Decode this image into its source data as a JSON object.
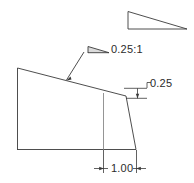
{
  "drawing": {
    "title": "Slope batter detail",
    "stroke_color": "#3a3a3a",
    "text_color": "#2b2b2b",
    "background_color": "#ffffff",
    "line_width": 0.8
  },
  "annotations": {
    "slope_ratio": "0.25:1",
    "rise": "0.25",
    "run": "1.00"
  },
  "icons": {
    "reference_slope_triangle": "slope-triangle-icon",
    "label_slope_triangle": "slope-triangle-small-icon",
    "leader_arrow": "leader-arrowhead-icon",
    "rise_arrow": "dimension-arrowhead-icon",
    "run_arrow_left": "dimension-arrowhead-left-icon",
    "run_arrow_right": "dimension-arrowhead-right-icon"
  },
  "geometry": {
    "body_outline": "17,68 126,96 136,150 17,150",
    "sloped_top_edge": "17,68 126,96",
    "interior_vertical": "103,93 103,150",
    "reference_triangle": "128,11 128,29 187,29",
    "label_triangle": "88,46 88,53 111,53",
    "leader_line": "84,52 66,80",
    "rise_extension_upper": "126,88 146,88",
    "rise_extension_lower": "126,98 146,98",
    "rise_dimension_line": "137,88 137,98",
    "run_extension_left": "103,150 103,172",
    "run_extension_right": "136,150 136,172",
    "run_dimension_line": "95,168 144,168"
  }
}
